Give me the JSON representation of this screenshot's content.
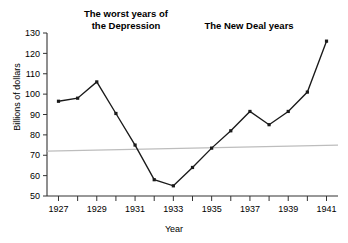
{
  "chart_data": {
    "type": "line",
    "title": "",
    "xlabel": "Year",
    "ylabel": "Billions of dollars",
    "xlim": [
      1926.4,
      1941.6
    ],
    "ylim": [
      50,
      130
    ],
    "y_ticks": [
      50,
      60,
      70,
      80,
      90,
      100,
      110,
      120,
      130
    ],
    "x_ticks": [
      1927,
      1928,
      1929,
      1930,
      1931,
      1932,
      1933,
      1934,
      1935,
      1936,
      1937,
      1938,
      1939,
      1940,
      1941
    ],
    "x_tick_labels": [
      "1927",
      "",
      "1929",
      "",
      "1931",
      "",
      "1933",
      "",
      "1935",
      "",
      "1937",
      "",
      "1939",
      "",
      "1941"
    ],
    "grid": false,
    "legend_position": "none",
    "x": [
      1927,
      1928,
      1929,
      1930,
      1931,
      1932,
      1933,
      1934,
      1935,
      1936,
      1937,
      1938,
      1939,
      1940,
      1941
    ],
    "values": [
      96.5,
      98.0,
      106.0,
      90.5,
      75.0,
      58.0,
      55.0,
      64.0,
      73.5,
      82.0,
      91.5,
      85.0,
      91.5,
      101.0,
      126.0
    ],
    "series": [
      {
        "name": "Billions of dollars",
        "color": "#1a1a1a",
        "values": [
          96.5,
          98.0,
          106.0,
          90.5,
          75.0,
          58.0,
          55.0,
          64.0,
          73.5,
          82.0,
          91.5,
          85.0,
          91.5,
          101.0,
          126.0
        ]
      },
      {
        "name": "trend-line",
        "color": "#bdbdbd",
        "values": [
          72.0,
          75.0
        ],
        "x": [
          1926.4,
          1941.6
        ]
      }
    ],
    "annotations": [
      {
        "text": "The worst years of\nthe Depression",
        "x": 1929.4,
        "y": 131
      },
      {
        "text": "The New Deal years",
        "x": 1934.8,
        "y": 128
      }
    ]
  },
  "axis": {
    "y_title": "Billions of dollars",
    "x_title": "Year"
  },
  "annotations": {
    "depression": "The worst years of\nthe Depression",
    "new_deal": "The New Deal years"
  },
  "colors": {
    "series": "#1a1a1a",
    "trend": "#bdbdbd",
    "axis": "#333333",
    "background": "#ffffff"
  }
}
